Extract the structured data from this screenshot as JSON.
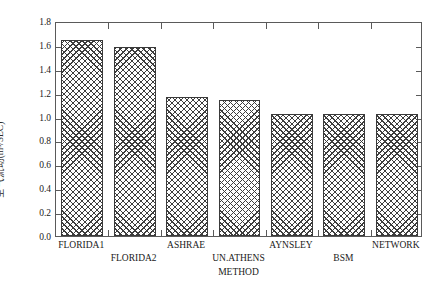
{
  "chart_data": {
    "type": "bar",
    "title": "",
    "xlabel": "METHOD",
    "ylabel": "空气流动(m³/SEC)",
    "categories": [
      "FLORIDA1",
      "FLORIDA2",
      "ASHRAE",
      "UN.ATHENS",
      "AYNSLEY",
      "BSM",
      "NETWORK"
    ],
    "values": [
      1.64,
      1.58,
      1.16,
      1.14,
      1.02,
      1.02,
      1.02
    ],
    "ylim": [
      0.0,
      1.8
    ],
    "ytick_step": 0.2,
    "ytick_labels": [
      "0.0",
      "0.2",
      "0.4",
      "0.6",
      "0.8",
      "1.0",
      "1.2",
      "1.4",
      "1.6",
      "1.8"
    ],
    "ytick_values": [
      0.0,
      0.2,
      0.4,
      0.6,
      0.8,
      1.0,
      1.2,
      1.4,
      1.6,
      1.8
    ],
    "grid": false,
    "legend": null,
    "legend_position": "none",
    "bar_fill": "crosshatch-pattern",
    "bar_edge_color": "#3a3a3a",
    "bar_pattern_color": "#3d3d3d",
    "axis_color": "#5a5a5a",
    "background_color": "#ffffff",
    "label_rows": [
      "top",
      "bottom",
      "top",
      "bottom",
      "top",
      "bottom",
      "top"
    ]
  }
}
